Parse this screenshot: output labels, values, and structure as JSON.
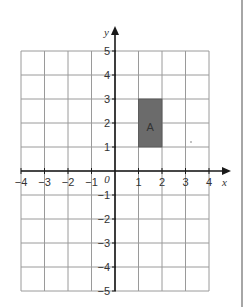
{
  "diagram": {
    "type": "coordinate-grid",
    "x_axis": {
      "label": "x",
      "min": -4,
      "max": 4,
      "ticks": [
        "-4",
        "-3",
        "-2",
        "-1",
        "1",
        "2",
        "3",
        "4"
      ]
    },
    "y_axis": {
      "label": "y",
      "min": -5,
      "max": 5,
      "ticks": [
        "5",
        "4",
        "3",
        "2",
        "1",
        "-1",
        "-2",
        "-3",
        "-4",
        "-5"
      ]
    },
    "origin_label": "0",
    "shapes": [
      {
        "name": "A",
        "label": "A",
        "type": "rectangle",
        "x1": 1,
        "y1": 1,
        "x2": 2,
        "y2": 3,
        "fill": "#6b6b6b"
      }
    ],
    "colors": {
      "grid": "#9a9a9a",
      "axis": "#1a1a1a",
      "border": "#888888"
    }
  }
}
